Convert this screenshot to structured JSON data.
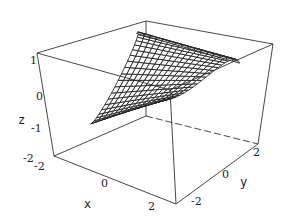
{
  "chart_data": {
    "type": "surface3d",
    "title": "",
    "axes": {
      "x": {
        "label": "x",
        "ticks": [
          "-2",
          "0",
          "2"
        ],
        "range": [
          -2,
          2
        ]
      },
      "y": {
        "label": "y",
        "ticks": [
          "-2",
          "0",
          "2"
        ],
        "range": [
          -2,
          2
        ]
      },
      "z": {
        "label": "z",
        "ticks": [
          "-2",
          "-1",
          "0",
          "1"
        ],
        "range": [
          -2,
          1
        ]
      }
    },
    "box": {
      "corners_px": {
        "top_back_left": [
          37,
          53
        ],
        "bottom_back_left": [
          54,
          156
        ],
        "bottom_front": [
          176,
          204
        ],
        "bottom_back_right": [
          258,
          144
        ],
        "top_back_right": [
          273,
          44
        ],
        "top_back": [
          146,
          21
        ],
        "top_front": [
          170,
          90
        ],
        "bottom_back": [
          146,
          116
        ]
      }
    },
    "surface": {
      "description": "Parabolic-cylinder-like mesh surface opening toward +y, wireframe with white faces",
      "mesh_color": "#111111",
      "face_color": "#ffffff",
      "u_lines": 24,
      "v_lines": 16
    },
    "grid": false,
    "legend": null
  },
  "labels": {
    "z_ticks": [
      {
        "text": "1",
        "x": 30,
        "y": 64
      },
      {
        "text": "0",
        "x": 36,
        "y": 100
      },
      {
        "text": "-1",
        "x": 31,
        "y": 132
      },
      {
        "text": "-2",
        "x": 23,
        "y": 162
      }
    ],
    "x_ticks": [
      {
        "text": "-2",
        "x": 34,
        "y": 170
      },
      {
        "text": "0",
        "x": 101,
        "y": 187
      },
      {
        "text": "2",
        "x": 148,
        "y": 210
      }
    ],
    "y_ticks": [
      {
        "text": "-2",
        "x": 191,
        "y": 205
      },
      {
        "text": "0",
        "x": 222,
        "y": 178
      },
      {
        "text": "2",
        "x": 253,
        "y": 156
      }
    ],
    "z_label": {
      "text": "z",
      "x": 18,
      "y": 124
    },
    "x_label": {
      "text": "x",
      "x": 84,
      "y": 208
    },
    "y_label": {
      "text": "y",
      "x": 240,
      "y": 186
    }
  }
}
